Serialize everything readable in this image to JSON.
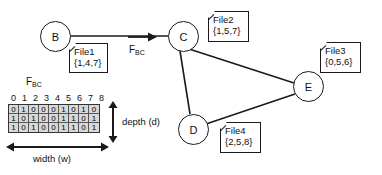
{
  "diagram": {
    "title_label": "",
    "nodes": [
      {
        "id": "B",
        "label": "B",
        "x": 40,
        "y": 21,
        "d": 31
      },
      {
        "id": "C",
        "label": "C",
        "x": 168,
        "y": 21,
        "d": 31
      },
      {
        "id": "D",
        "label": "D",
        "x": 178,
        "y": 114,
        "d": 31
      },
      {
        "id": "E",
        "label": "E",
        "x": 293,
        "y": 71,
        "d": 31
      }
    ],
    "edges": [
      {
        "from": "B",
        "to": "C",
        "kind": "plain"
      },
      {
        "from": "C",
        "to": "D",
        "kind": "plain"
      },
      {
        "from": "C",
        "to": "E",
        "kind": "plain"
      },
      {
        "from": "D",
        "to": "E",
        "kind": "plain"
      }
    ],
    "file_boxes": [
      {
        "id": "file1",
        "name": "File1",
        "set": "{1,4,7}",
        "x": 69,
        "y": 43,
        "w": 39,
        "h": 30
      },
      {
        "id": "file2",
        "name": "File2",
        "set": "{1,5,7}",
        "x": 208,
        "y": 11,
        "w": 41,
        "h": 31
      },
      {
        "id": "file3",
        "name": "File3",
        "set": "{0,5,6}",
        "x": 320,
        "y": 42,
        "w": 41,
        "h": 31
      },
      {
        "id": "file4",
        "name": "File4",
        "set": "{2,5,8}",
        "x": 220,
        "y": 122,
        "w": 41,
        "h": 31
      }
    ],
    "arrow_label": {
      "base": "F",
      "sub": "BC",
      "x": 129,
      "y": 46
    },
    "bitmap_title": {
      "base": "F",
      "sub": "BC",
      "x": 28,
      "y": 77
    }
  },
  "bitmap": {
    "col_headers": [
      "0",
      "1",
      "2",
      "3",
      "4",
      "5",
      "6",
      "7",
      "8"
    ],
    "rows": [
      [
        "0",
        "1",
        "0",
        "0",
        "0",
        "1",
        "0",
        "1",
        "0"
      ],
      [
        "1",
        "0",
        "1",
        "0",
        "0",
        "1",
        "1",
        "0",
        "1"
      ],
      [
        "1",
        "0",
        "1",
        "0",
        "0",
        "1",
        "1",
        "0",
        "1"
      ]
    ],
    "depth_label": "depth (d)",
    "width_label": "width (w)"
  },
  "colors": {
    "stroke": "#1a1a1a",
    "cell_fill": "#d8d8d8",
    "grid_line": "#555555",
    "background": "#ffffff"
  }
}
